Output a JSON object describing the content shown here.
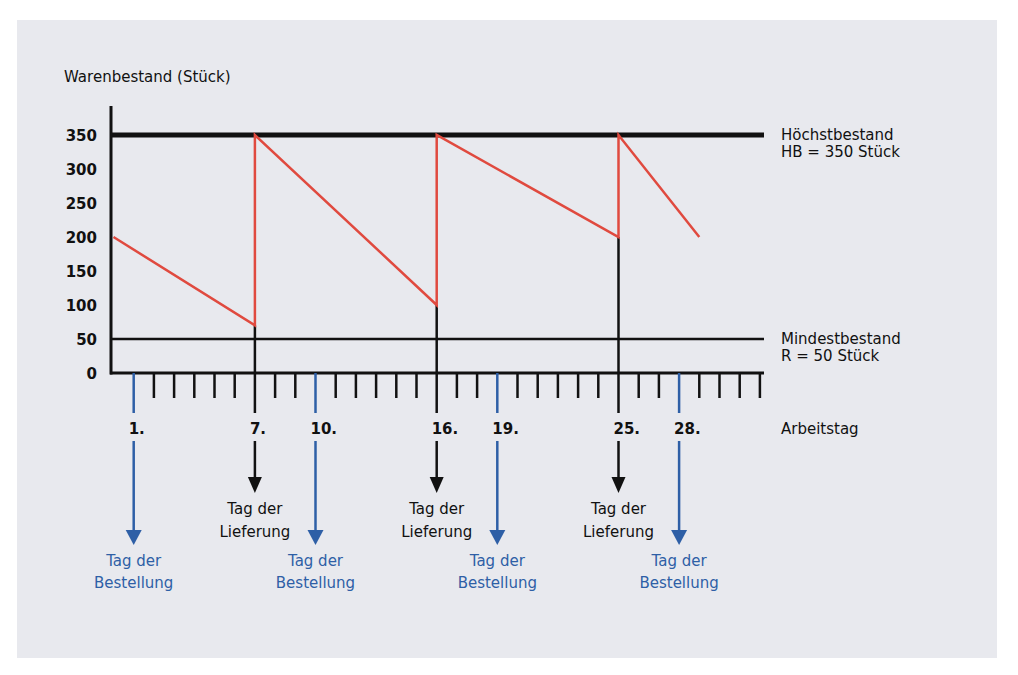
{
  "colors": {
    "background": "#e8e9ee",
    "axis": "#111111",
    "stock_line": "#e04a3f",
    "order_arrow": "#2e5fa6",
    "delivery_arrow": "#111111"
  },
  "chart_data": {
    "type": "line",
    "title": "",
    "ylabel": "Warenbestand (Stück)",
    "xlabel": "Arbeitstag",
    "ylim": [
      0,
      350
    ],
    "xlim": [
      0,
      32
    ],
    "y_ticks": [
      "0",
      "50",
      "100",
      "150",
      "200",
      "250",
      "300",
      "350"
    ],
    "x_tick_labels": [
      {
        "day": 1,
        "label": "1."
      },
      {
        "day": 7,
        "label": "7."
      },
      {
        "day": 10,
        "label": "10."
      },
      {
        "day": 16,
        "label": "16."
      },
      {
        "day": 19,
        "label": "19."
      },
      {
        "day": 25,
        "label": "25."
      },
      {
        "day": 28,
        "label": "28."
      }
    ],
    "series": [
      {
        "name": "Warenbestand",
        "points": [
          [
            0,
            200
          ],
          [
            7,
            70
          ],
          [
            7,
            350
          ],
          [
            16,
            100
          ],
          [
            16,
            350
          ],
          [
            25,
            200
          ],
          [
            25,
            350
          ],
          [
            29,
            200
          ]
        ]
      }
    ],
    "reference_lines": [
      {
        "name": "Höchstbestand",
        "value": 350,
        "label_line1": "Höchstbestand",
        "label_line2": "HB = 350 Stück"
      },
      {
        "name": "Mindestbestand",
        "value": 50,
        "label_line1": "Mindestbestand",
        "label_line2": "R = 50 Stück"
      }
    ],
    "annotations": {
      "deliveries": [
        {
          "day": 7,
          "line1": "Tag der",
          "line2": "Lieferung"
        },
        {
          "day": 16,
          "line1": "Tag der",
          "line2": "Lieferung"
        },
        {
          "day": 25,
          "line1": "Tag der",
          "line2": "Lieferung"
        }
      ],
      "orders": [
        {
          "day": 1,
          "line1": "Tag der",
          "line2": "Bestellung"
        },
        {
          "day": 10,
          "line1": "Tag der",
          "line2": "Bestellung"
        },
        {
          "day": 19,
          "line1": "Tag der",
          "line2": "Bestellung"
        },
        {
          "day": 28,
          "line1": "Tag der",
          "line2": "Bestellung"
        }
      ]
    },
    "grid": false,
    "legend": "none"
  }
}
